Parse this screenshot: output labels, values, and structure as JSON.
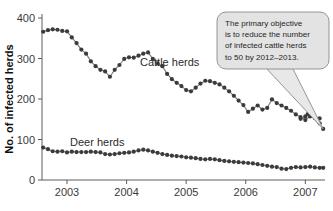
{
  "chart_data": {
    "type": "line",
    "title": "",
    "xlabel": "",
    "ylabel": "No. of infected herds",
    "ylim": [
      0,
      400
    ],
    "xlim": [
      2002.58,
      2007.33
    ],
    "grid": false,
    "legend_position": "inline-labels",
    "yticks": [
      0,
      100,
      200,
      300,
      400
    ],
    "xticks": [
      2003,
      2004,
      2005,
      2006,
      2007
    ],
    "ytick_labels": [
      "0",
      "100",
      "200",
      "300",
      "400"
    ],
    "xtick_labels": [
      "2003",
      "2004",
      "2005",
      "2006",
      "2007"
    ],
    "series": [
      {
        "name": "Cattle herds",
        "label": "Cattle herds",
        "marker": "filled-circle",
        "x": [
          2002.6,
          2002.68,
          2002.76,
          2002.84,
          2002.92,
          2003.0,
          2003.08,
          2003.16,
          2003.24,
          2003.32,
          2003.4,
          2003.48,
          2003.56,
          2003.64,
          2003.72,
          2003.8,
          2003.88,
          2003.96,
          2004.04,
          2004.12,
          2004.2,
          2004.28,
          2004.36,
          2004.44,
          2004.52,
          2004.6,
          2004.68,
          2004.76,
          2004.84,
          2004.92,
          2005.0,
          2005.08,
          2005.16,
          2005.24,
          2005.32,
          2005.4,
          2005.48,
          2005.56,
          2005.64,
          2005.72,
          2005.8,
          2005.88,
          2005.96,
          2006.04,
          2006.12,
          2006.2,
          2006.28,
          2006.36,
          2006.44,
          2006.52,
          2006.6,
          2006.68,
          2006.76,
          2006.84,
          2006.92,
          2007.0,
          2007.08,
          2007.16,
          2007.24
        ],
        "values": [
          366,
          370,
          372,
          371,
          368,
          367,
          352,
          338,
          322,
          312,
          293,
          281,
          272,
          268,
          255,
          272,
          284,
          299,
          303,
          302,
          307,
          312,
          315,
          299,
          288,
          281,
          262,
          249,
          240,
          232,
          222,
          219,
          228,
          238,
          245,
          244,
          240,
          236,
          228,
          219,
          208,
          196,
          185,
          168,
          176,
          184,
          174,
          178,
          199,
          190,
          184,
          178,
          171,
          162,
          155,
          148,
          157,
          153,
          152
        ]
      },
      {
        "name": "Cattle herds extension",
        "label": "",
        "marker": "filled-circle",
        "x": [
          2006.92,
          2007.0,
          2007.04,
          2007.08,
          2007.12,
          2007.16,
          2007.2,
          2007.24,
          2007.3
        ],
        "values": [
          151,
          157,
          163,
          166,
          161,
          155,
          148,
          140,
          126
        ]
      },
      {
        "name": "Deer herds",
        "label": "Deer herds",
        "marker": "filled-circle",
        "x": [
          2002.6,
          2002.68,
          2002.76,
          2002.84,
          2002.92,
          2003.0,
          2003.08,
          2003.16,
          2003.24,
          2003.32,
          2003.4,
          2003.48,
          2003.56,
          2003.64,
          2003.72,
          2003.8,
          2003.88,
          2003.96,
          2004.04,
          2004.12,
          2004.2,
          2004.28,
          2004.36,
          2004.44,
          2004.52,
          2004.6,
          2004.68,
          2004.76,
          2004.84,
          2004.92,
          2005.0,
          2005.08,
          2005.16,
          2005.24,
          2005.32,
          2005.4,
          2005.48,
          2005.56,
          2005.64,
          2005.72,
          2005.8,
          2005.88,
          2005.96,
          2006.04,
          2006.12,
          2006.2,
          2006.28,
          2006.36,
          2006.44,
          2006.52,
          2006.6,
          2006.68,
          2006.76,
          2006.84,
          2006.92,
          2007.0,
          2007.08,
          2007.16,
          2007.24,
          2007.3
        ],
        "values": [
          80,
          76,
          71,
          70,
          71,
          68,
          70,
          69,
          69,
          69,
          70,
          69,
          68,
          64,
          63,
          64,
          66,
          67,
          68,
          70,
          73,
          75,
          73,
          70,
          67,
          64,
          62,
          60,
          59,
          58,
          56,
          55,
          54,
          52,
          51,
          52,
          51,
          49,
          47,
          46,
          45,
          44,
          43,
          42,
          41,
          39,
          37,
          35,
          33,
          32,
          28,
          27,
          30,
          32,
          31,
          32,
          33,
          31,
          30,
          30
        ]
      }
    ],
    "annotations": [
      {
        "name": "objective-callout",
        "lines": [
          "The primary objective",
          "is to reduce the number",
          "of infected cattle herds",
          "to 50 by 2012–2013."
        ],
        "points_to_series": "Cattle herds",
        "points_to_value": 126
      }
    ],
    "colors": {
      "marker": "#3b3b3b",
      "line": "#7a7a7a",
      "axis": "#5c5c5c",
      "callout_fill": "#e3e3e3",
      "callout_border": "#8a8a8a",
      "text": "#262626"
    }
  }
}
